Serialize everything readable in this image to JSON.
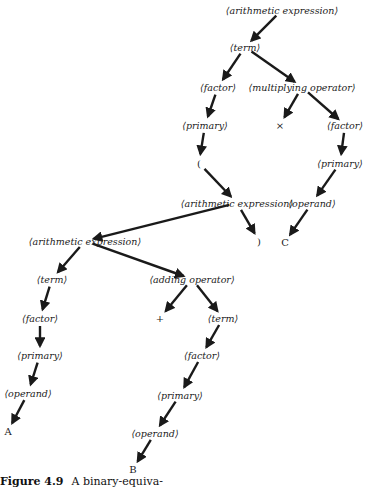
{
  "diagram": {
    "type": "parse-tree",
    "nodes": [
      {
        "id": "n0",
        "label": "⟨arithmetic expression⟩",
        "kind": "nonterminal",
        "x": 282,
        "y": 10
      },
      {
        "id": "n1",
        "label": "⟨term⟩",
        "kind": "nonterminal",
        "x": 245,
        "y": 47
      },
      {
        "id": "n2",
        "label": "⟨factor⟩",
        "kind": "nonterminal",
        "x": 218,
        "y": 87
      },
      {
        "id": "n3",
        "label": "⟨multiplying operator⟩",
        "kind": "nonterminal",
        "x": 302,
        "y": 87
      },
      {
        "id": "n4",
        "label": "⟨primary⟩",
        "kind": "nonterminal",
        "x": 205,
        "y": 125
      },
      {
        "id": "n5",
        "label": "×",
        "kind": "terminal",
        "x": 280,
        "y": 125
      },
      {
        "id": "n6",
        "label": "⟨factor⟩",
        "kind": "nonterminal",
        "x": 345,
        "y": 125
      },
      {
        "id": "n7",
        "label": "(",
        "kind": "terminal",
        "x": 199,
        "y": 163
      },
      {
        "id": "n8",
        "label": "⟨primary⟩",
        "kind": "nonterminal",
        "x": 340,
        "y": 163
      },
      {
        "id": "n9",
        "label": "⟨arithmetic expression⟩",
        "kind": "nonterminal",
        "x": 237,
        "y": 203
      },
      {
        "id": "n10",
        "label": "⟨operand⟩",
        "kind": "nonterminal",
        "x": 312,
        "y": 203
      },
      {
        "id": "n11",
        "label": "⟨arithmetic expression⟩",
        "kind": "nonterminal",
        "x": 85,
        "y": 241
      },
      {
        "id": "n12",
        "label": ")",
        "kind": "terminal",
        "x": 259,
        "y": 241
      },
      {
        "id": "n13",
        "label": "C",
        "kind": "terminal",
        "x": 285,
        "y": 242
      },
      {
        "id": "n14",
        "label": "⟨term⟩",
        "kind": "nonterminal",
        "x": 52,
        "y": 279
      },
      {
        "id": "n15",
        "label": "⟨adding operator⟩",
        "kind": "nonterminal",
        "x": 192,
        "y": 279
      },
      {
        "id": "n16",
        "label": "⟨factor⟩",
        "kind": "nonterminal",
        "x": 40,
        "y": 318
      },
      {
        "id": "n17",
        "label": "+",
        "kind": "terminal",
        "x": 160,
        "y": 318
      },
      {
        "id": "n18",
        "label": "⟨term⟩",
        "kind": "nonterminal",
        "x": 223,
        "y": 318
      },
      {
        "id": "n19",
        "label": "⟨primary⟩",
        "kind": "nonterminal",
        "x": 40,
        "y": 355
      },
      {
        "id": "n20",
        "label": "⟨factor⟩",
        "kind": "nonterminal",
        "x": 202,
        "y": 355
      },
      {
        "id": "n21",
        "label": "⟨operand⟩",
        "kind": "nonterminal",
        "x": 28,
        "y": 393
      },
      {
        "id": "n22",
        "label": "⟨primary⟩",
        "kind": "nonterminal",
        "x": 180,
        "y": 395
      },
      {
        "id": "n23",
        "label": "A",
        "kind": "terminal",
        "x": 8,
        "y": 431
      },
      {
        "id": "n24",
        "label": "⟨operand⟩",
        "kind": "nonterminal",
        "x": 155,
        "y": 433
      },
      {
        "id": "n25",
        "label": "B",
        "kind": "terminal",
        "x": 133,
        "y": 469
      }
    ],
    "edges": [
      [
        "n0",
        "n1"
      ],
      [
        "n1",
        "n2"
      ],
      [
        "n1",
        "n3"
      ],
      [
        "n2",
        "n4"
      ],
      [
        "n3",
        "n5"
      ],
      [
        "n3",
        "n6"
      ],
      [
        "n4",
        "n7"
      ],
      [
        "n6",
        "n8"
      ],
      [
        "n7",
        "n9"
      ],
      [
        "n8",
        "n10"
      ],
      [
        "n9",
        "n11"
      ],
      [
        "n9",
        "n12"
      ],
      [
        "n10",
        "n13"
      ],
      [
        "n11",
        "n14"
      ],
      [
        "n11",
        "n15"
      ],
      [
        "n14",
        "n16"
      ],
      [
        "n15",
        "n17"
      ],
      [
        "n15",
        "n18"
      ],
      [
        "n16",
        "n19"
      ],
      [
        "n18",
        "n20"
      ],
      [
        "n19",
        "n21"
      ],
      [
        "n20",
        "n22"
      ],
      [
        "n21",
        "n23"
      ],
      [
        "n22",
        "n24"
      ],
      [
        "n24",
        "n25"
      ]
    ],
    "colors": {
      "ink": "#1a1a1a",
      "background": "#ffffff"
    }
  },
  "caption": {
    "label": "Figure 4.9",
    "text": "A binary-equiva-"
  }
}
